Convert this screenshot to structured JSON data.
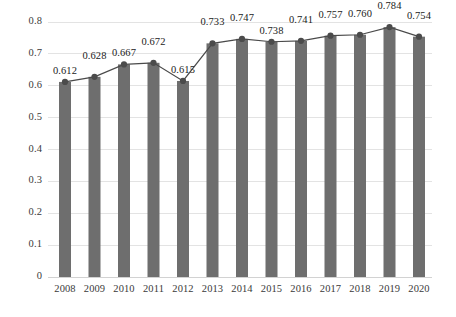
{
  "chart_data": {
    "type": "bar",
    "title": "",
    "subtitle": "",
    "xlabel": "",
    "ylabel": "",
    "categories": [
      "2008",
      "2009",
      "2010",
      "2011",
      "2012",
      "2013",
      "2014",
      "2015",
      "2016",
      "2017",
      "2018",
      "2019",
      "2020"
    ],
    "values": [
      0.612,
      0.628,
      0.667,
      0.672,
      0.615,
      0.733,
      0.747,
      0.738,
      0.741,
      0.757,
      0.76,
      0.784,
      0.754
    ],
    "data_labels": [
      "0.612",
      "0.628",
      "0.667",
      "0.672",
      "0.615",
      "0.733",
      "0.747",
      "0.738",
      "0.741",
      "0.757",
      "0.760",
      "0.784",
      "0.754"
    ],
    "series": [
      {
        "name": "bars",
        "kind": "bar",
        "values": [
          0.612,
          0.628,
          0.667,
          0.672,
          0.615,
          0.733,
          0.747,
          0.738,
          0.741,
          0.757,
          0.76,
          0.784,
          0.754
        ]
      },
      {
        "name": "trend-line",
        "kind": "line",
        "values": [
          0.612,
          0.628,
          0.667,
          0.672,
          0.615,
          0.733,
          0.747,
          0.738,
          0.741,
          0.757,
          0.76,
          0.784,
          0.754
        ]
      }
    ],
    "ylim": [
      0,
      0.8
    ],
    "ytick_labels": [
      "0.8",
      "0.7",
      "0.6",
      "0.5",
      "0.4",
      "0.3",
      "0.2",
      "0.1",
      "0"
    ],
    "ytick_values": [
      0.8,
      0.7,
      0.6,
      0.5,
      0.4,
      0.3,
      0.2,
      0.1,
      0
    ],
    "grid": true,
    "grid_axis": "y",
    "legend": false,
    "legend_position": "none",
    "annotations": [],
    "colors": {
      "bar_fill": "#6e6e6e",
      "line": "#4a4a4a",
      "marker": "#4b4b4b",
      "grid": "#e3e3e3",
      "axis_text": "#3a3a3a",
      "label_text": "#222222",
      "background": "#ffffff"
    }
  }
}
